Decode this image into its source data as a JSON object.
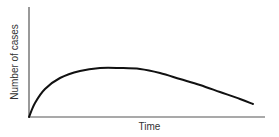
{
  "chart_data": {
    "type": "line",
    "title": "",
    "xlabel": "Time",
    "ylabel": "Number of cases",
    "grid": false,
    "legend": null,
    "x_ticks": [],
    "y_ticks": [],
    "series": [
      {
        "name": "cases",
        "color": "#111111",
        "points_px": [
          [
            29,
            117
          ],
          [
            35,
            103
          ],
          [
            45,
            89
          ],
          [
            60,
            78
          ],
          [
            80,
            71
          ],
          [
            100,
            68
          ],
          [
            120,
            68
          ],
          [
            140,
            69
          ],
          [
            160,
            73
          ],
          [
            180,
            79
          ],
          [
            200,
            85
          ],
          [
            220,
            92
          ],
          [
            240,
            99
          ],
          [
            253,
            104
          ]
        ],
        "description": "Rapid rise from zero to a broad peak, then a gradual decline"
      }
    ],
    "axes_px": {
      "origin": [
        29,
        117
      ],
      "y_top": 7,
      "x_right": 265
    }
  },
  "colors": {
    "axis": "#555555",
    "curve": "#111111",
    "text": "#333333"
  }
}
